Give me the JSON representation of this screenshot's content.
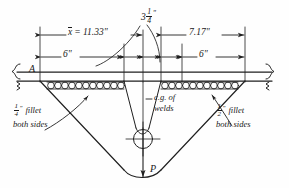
{
  "figure": {
    "ink_color": "#1f1f1f",
    "background": "#fefefe"
  },
  "dimensions": {
    "xbar": {
      "symbol": "x",
      "overbar": true,
      "text": "= 11.33\"",
      "full": "x̄ = 11.33\"",
      "value": 11.33,
      "unit": "in"
    },
    "right_total": {
      "text": "7.17\"",
      "value": 7.17,
      "unit": "in"
    },
    "center_gap": {
      "whole": "3",
      "num": "1",
      "den": "4",
      "unit": "\"",
      "full": "3 1/4\"",
      "value": 3.25
    },
    "left_weld": {
      "text": "6\"",
      "value": 6,
      "unit": "in"
    },
    "right_weld": {
      "text": "6\"",
      "value": 6,
      "unit": "in"
    }
  },
  "labels": {
    "section_mark": "A",
    "force": "P",
    "cg_note_line1": "c.g. of",
    "cg_note_line2": "welds"
  },
  "notes": {
    "left_fillet": {
      "num": "1",
      "den": "4",
      "unit": "\"",
      "word": "fillet",
      "line2": "both sides",
      "full": "1/4\" fillet both sides"
    },
    "right_fillet": {
      "num": "1",
      "den": "2",
      "unit": "\"",
      "word": "fillet",
      "line2": "both sides",
      "full": "1/2\" fillet both sides"
    }
  }
}
